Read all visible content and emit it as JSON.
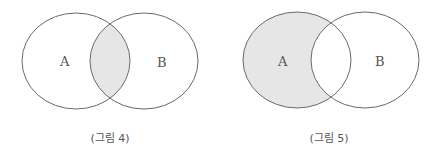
{
  "figures": [
    {
      "caption": "(그림 4)",
      "set_a_label": "A",
      "set_b_label": "B",
      "shaded_region": "A ∩ B"
    },
    {
      "caption": "(그림 5)",
      "set_a_label": "A",
      "set_b_label": "B",
      "shaded_region": "A − B"
    }
  ],
  "colors": {
    "outline": "#6a6a6a",
    "shade": "#e6e6e6",
    "label": "#555555"
  }
}
